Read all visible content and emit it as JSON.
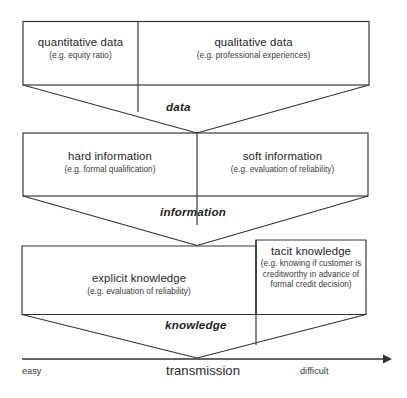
{
  "diagram": {
    "canvas": {
      "width": 407,
      "height": 398,
      "background": "#ffffff"
    },
    "line_color": "#333333",
    "text_color": "#2b2b2b",
    "levels": [
      {
        "stage_label": "data",
        "cells": [
          {
            "title": "quantitative data",
            "subtitle": "(e.g. equity ratio)"
          },
          {
            "title": "qualitative data",
            "subtitle": "(e.g. professional experiences)"
          }
        ]
      },
      {
        "stage_label": "information",
        "cells": [
          {
            "title": "hard information",
            "subtitle": "(e.g. formal qualification)"
          },
          {
            "title": "soft information",
            "subtitle": "(e.g. evaluation of reliability)"
          }
        ]
      },
      {
        "stage_label": "knowledge",
        "cells": [
          {
            "title": "explicit knowledge",
            "subtitle": "(e.g. evaluation of reliability)"
          },
          {
            "title": "tacit knowledge",
            "subtitle": "(e.g. knowing if customer is creditworthy in advance of formal credit decision)"
          }
        ]
      }
    ],
    "axis": {
      "label": "transmission",
      "left_end": "easy",
      "right_end": "difficult",
      "arrow": "right-arrow-icon"
    }
  }
}
